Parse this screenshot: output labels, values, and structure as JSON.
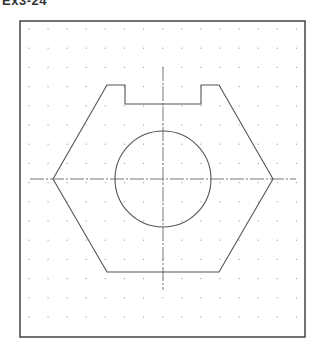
{
  "title": "Ex3-24",
  "colors": {
    "frame": "#444444",
    "outline": "#555555",
    "centerline": "#777777",
    "grid_dot": "#aaaaaa",
    "background": "#ffffff"
  },
  "frame": {
    "x": 20,
    "y": 21,
    "width": 285,
    "height": 316
  },
  "grid": {
    "x0": 29,
    "y0": 29,
    "step_x": 19.1,
    "step_y": 19.2,
    "cols": 15,
    "rows": 17
  },
  "outline": {
    "points": [
      [
        53,
        179
      ],
      [
        107,
        85
      ],
      [
        125,
        85
      ],
      [
        125,
        104
      ],
      [
        201,
        104
      ],
      [
        201,
        85
      ],
      [
        219,
        85
      ],
      [
        273,
        179
      ],
      [
        219,
        272
      ],
      [
        107,
        272
      ]
    ]
  },
  "circle": {
    "cx": 163,
    "cy": 179,
    "r": 48
  },
  "centerlines": {
    "horizontal": {
      "x1": 30,
      "y": 179,
      "x2": 296
    },
    "vertical": {
      "x": 163,
      "y1": 67,
      "y2": 290
    }
  }
}
